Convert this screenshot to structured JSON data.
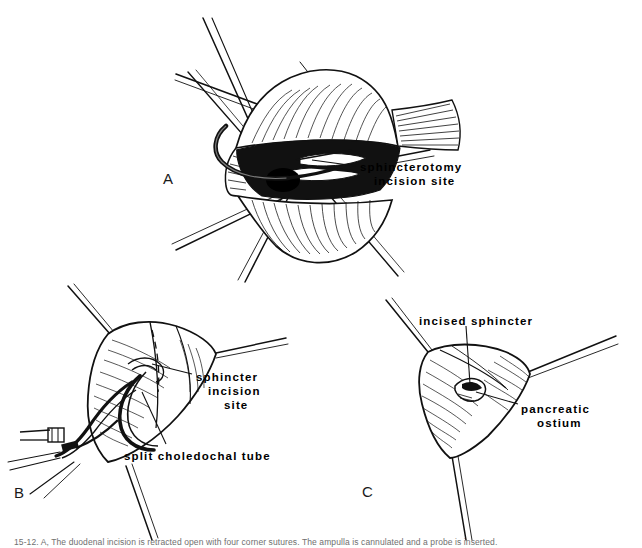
{
  "figure": {
    "type": "medical-line-illustration",
    "background_color": "#ffffff",
    "ink_color": "#000000",
    "panels": [
      {
        "letter": "A",
        "description": "Opened duodenum held by radiating retraction sutures exposing the ampulla of Vater; an instrument lies in the common bile duct orifice.",
        "labels": [
          "sphincterotomy incision site"
        ]
      },
      {
        "letter": "B",
        "description": "Split choledochal tube passed through the ampulla with a dashed line marking the planned sphincter incision.",
        "labels": [
          "sphincter incision site",
          "split choledochal tube"
        ]
      },
      {
        "letter": "C",
        "description": "Completed sphincterotomy with the incised sphincter everted and the pancreatic ostium visible within the ampulla.",
        "labels": [
          "incised sphincter",
          "pancreatic ostium"
        ]
      }
    ]
  },
  "labels": {
    "a_sphincterotomy_line1": "sphincterotomy",
    "a_sphincterotomy_line2": "incision site",
    "b_sphincter_line1": "sphincter",
    "b_sphincter_line2": "incision",
    "b_sphincter_line3": "site",
    "b_split_tube": "split choledochal tube",
    "c_incised_sphincter": "incised sphincter",
    "c_pancreatic_line1": "pancreatic",
    "c_pancreatic_line2": "ostium"
  },
  "panel_letters": {
    "a": "A",
    "b": "B",
    "c": "C"
  },
  "caption": {
    "text": "15-12.   A, The duodenal incision is retracted open with four corner sutures.   The ampulla is cannulated and a probe is inserted."
  }
}
